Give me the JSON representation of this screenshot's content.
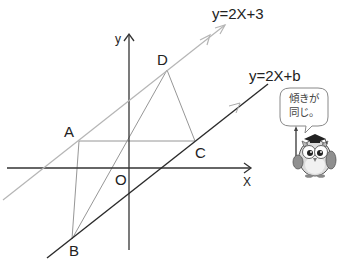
{
  "equations": {
    "line1": "y=2X+3",
    "line2": "y=2X+b"
  },
  "axes": {
    "x_label": "X",
    "y_label": "y",
    "origin_label": "O"
  },
  "points": {
    "A": "A",
    "B": "B",
    "C": "C",
    "D": "D"
  },
  "speech_bubble": {
    "line1": "傾きが",
    "line2": "同じ。"
  },
  "colors": {
    "line1": "#b5b5b5",
    "line2": "#2a2a2a",
    "axes": "#333333",
    "quad": "#8a8a8a"
  }
}
